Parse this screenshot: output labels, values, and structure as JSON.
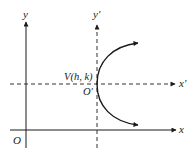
{
  "diagram": {
    "type": "coordinate-translation-parabola",
    "colors": {
      "axis": "#1a1a1a",
      "dashed_axis": "#333333",
      "curve": "#1a1a1a",
      "background": "#ffffff"
    },
    "labels": {
      "y_axis": "y",
      "x_axis": "x",
      "origin": "O",
      "y_prime_axis": "y′",
      "x_prime_axis": "x′",
      "vertex": "V(h, k)",
      "origin_prime": "O′"
    }
  }
}
